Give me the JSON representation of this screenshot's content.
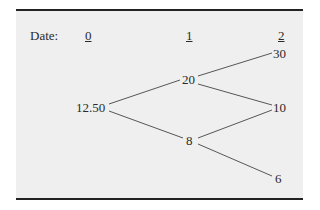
{
  "header": {
    "date_label": "Date:",
    "dates": [
      "0",
      "1",
      "2"
    ]
  },
  "tree": {
    "root": "12.50",
    "date1": {
      "up": "20",
      "down": "8"
    },
    "date2": {
      "uu": "30",
      "ud_du": "10",
      "dd": "6"
    }
  },
  "colors": {
    "background": "#efefef",
    "rule": "#222222",
    "line": "#444444"
  }
}
